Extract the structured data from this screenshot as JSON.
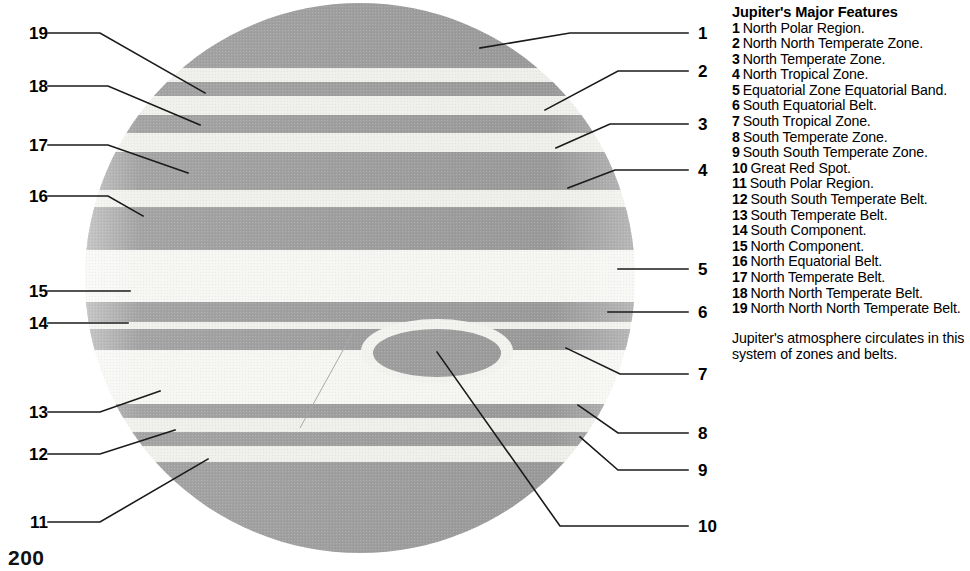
{
  "folio": "200",
  "legend": {
    "title": "Jupiter's Major Features",
    "items": [
      {
        "index": "1",
        "label": "North Polar Region."
      },
      {
        "index": "2",
        "label": "North North Temperate Zone."
      },
      {
        "index": "3",
        "label": "North Temperate Zone."
      },
      {
        "index": "4",
        "label": "North Tropical Zone."
      },
      {
        "index": "5",
        "label": "Equatorial Zone Equatorial Band."
      },
      {
        "index": "6",
        "label": "South Equatorial Belt."
      },
      {
        "index": "7",
        "label": "South Tropical Zone."
      },
      {
        "index": "8",
        "label": "South Temperate Zone."
      },
      {
        "index": "9",
        "label": "South South Temperate Zone."
      },
      {
        "index": "10",
        "label": "Great Red Spot."
      },
      {
        "index": "11",
        "label": "South Polar Region."
      },
      {
        "index": "12",
        "label": "South South Temperate Belt."
      },
      {
        "index": "13",
        "label": "South Temperate Belt."
      },
      {
        "index": "14",
        "label": "South Component."
      },
      {
        "index": "15",
        "label": "North Component."
      },
      {
        "index": "16",
        "label": "North Equatorial Belt."
      },
      {
        "index": "17",
        "label": "North Temperate Belt."
      },
      {
        "index": "18",
        "label": "North North Temperate Belt."
      },
      {
        "index": "19",
        "label": "North North North Temperate Belt."
      }
    ],
    "note": "Jupiter's atmosphere circulates in this system of zones and belts."
  },
  "callouts": {
    "left": [
      {
        "index": "19",
        "x": 8,
        "y": 33
      },
      {
        "index": "18",
        "x": 8,
        "y": 86
      },
      {
        "index": "17",
        "x": 8,
        "y": 145
      },
      {
        "index": "16",
        "x": 8,
        "y": 196
      },
      {
        "index": "15",
        "x": 8,
        "y": 291
      },
      {
        "index": "14",
        "x": 8,
        "y": 323
      },
      {
        "index": "13",
        "x": 8,
        "y": 412
      },
      {
        "index": "12",
        "x": 8,
        "y": 454
      },
      {
        "index": "11",
        "x": 8,
        "y": 522
      }
    ],
    "right": [
      {
        "index": "1",
        "x": 698,
        "y": 33
      },
      {
        "index": "2",
        "x": 698,
        "y": 71
      },
      {
        "index": "3",
        "x": 698,
        "y": 124
      },
      {
        "index": "4",
        "x": 698,
        "y": 170
      },
      {
        "index": "5",
        "x": 698,
        "y": 269
      },
      {
        "index": "6",
        "x": 698,
        "y": 312
      },
      {
        "index": "7",
        "x": 698,
        "y": 374
      },
      {
        "index": "8",
        "x": 698,
        "y": 433
      },
      {
        "index": "9",
        "x": 698,
        "y": 470
      },
      {
        "index": "10",
        "x": 698,
        "y": 526
      }
    ]
  },
  "colors": {
    "belt_dark": "#9a9a9a",
    "belt_mid": "#a8a8a8",
    "zone_light": "#eeeeea",
    "zone_white": "#f5f5f2",
    "spot": "#9a9a9a",
    "leader_line": "#1a1a1a",
    "background": "#ffffff"
  },
  "planet": {
    "center_x": 360,
    "center_y": 278,
    "radius": 275,
    "bands": [
      {
        "name": "north-polar-region",
        "y0": 0,
        "y1": 68,
        "tone": "belt_dark"
      },
      {
        "name": "north-north-north-temperate-belt",
        "y0": 68,
        "y1": 82,
        "tone": "zone_light"
      },
      {
        "name": "north-north-temperate-zone",
        "y0": 82,
        "y1": 96,
        "tone": "belt_dark"
      },
      {
        "name": "north-north-temperate-belt",
        "y0": 96,
        "y1": 115,
        "tone": "zone_light"
      },
      {
        "name": "north-temperate-zone-band",
        "y0": 115,
        "y1": 133,
        "tone": "belt_dark"
      },
      {
        "name": "north-temperate-belt-gap",
        "y0": 133,
        "y1": 152,
        "tone": "zone_light"
      },
      {
        "name": "north-temperate-zone",
        "y0": 152,
        "y1": 190,
        "tone": "belt_dark"
      },
      {
        "name": "north-tropical-zone",
        "y0": 190,
        "y1": 207,
        "tone": "zone_light"
      },
      {
        "name": "north-equatorial-belt",
        "y0": 207,
        "y1": 250,
        "tone": "belt_dark"
      },
      {
        "name": "equatorial-zone",
        "y0": 250,
        "y1": 302,
        "tone": "zone_white"
      },
      {
        "name": "north-component",
        "y0": 302,
        "y1": 322,
        "tone": "belt_dark"
      },
      {
        "name": "component-gap",
        "y0": 322,
        "y1": 329,
        "tone": "zone_light"
      },
      {
        "name": "south-component",
        "y0": 329,
        "y1": 350,
        "tone": "belt_dark"
      },
      {
        "name": "south-tropical-zone",
        "y0": 350,
        "y1": 404,
        "tone": "zone_white"
      },
      {
        "name": "south-temperate-belt",
        "y0": 404,
        "y1": 418,
        "tone": "belt_dark"
      },
      {
        "name": "south-temperate-zone",
        "y0": 418,
        "y1": 432,
        "tone": "zone_light"
      },
      {
        "name": "south-south-temperate-belt",
        "y0": 432,
        "y1": 446,
        "tone": "belt_dark"
      },
      {
        "name": "south-south-temperate-zone",
        "y0": 446,
        "y1": 462,
        "tone": "zone_light"
      },
      {
        "name": "south-polar-region",
        "y0": 462,
        "y1": 571,
        "tone": "belt_dark"
      }
    ],
    "great_red_spot": {
      "cx": 437,
      "cy": 353,
      "rx": 64,
      "ry": 24
    },
    "red_spot_hollow": {
      "cx": 437,
      "cy": 351,
      "rx": 76,
      "ry": 32
    }
  }
}
